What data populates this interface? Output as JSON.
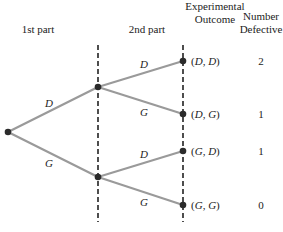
{
  "headers": {
    "first_part": "1st part",
    "second_part": "2nd part",
    "outcome_line1": "Experimental",
    "outcome_line2": "Outcome",
    "number_line1": "Number",
    "number_line2": "Defective"
  },
  "branches": {
    "first_upper": "D",
    "first_lower": "G",
    "upper_upper": "D",
    "upper_lower": "G",
    "lower_upper": "D",
    "lower_lower": "G"
  },
  "outcomes": [
    {
      "label_open": "(",
      "a": "D",
      "sep": ", ",
      "b": "D",
      "label_close": ")",
      "defective": "2"
    },
    {
      "label_open": "(",
      "a": "D",
      "sep": ", ",
      "b": "G",
      "label_close": ")",
      "defective": "1"
    },
    {
      "label_open": "(",
      "a": "G",
      "sep": ", ",
      "b": "D",
      "label_close": ")",
      "defective": "1"
    },
    {
      "label_open": "(",
      "a": "G",
      "sep": ", ",
      "b": "G",
      "label_close": ")",
      "defective": "0"
    }
  ],
  "colors": {
    "branch": "#9a9a9a",
    "node": "#2b2b2b",
    "dash": "#222222"
  }
}
